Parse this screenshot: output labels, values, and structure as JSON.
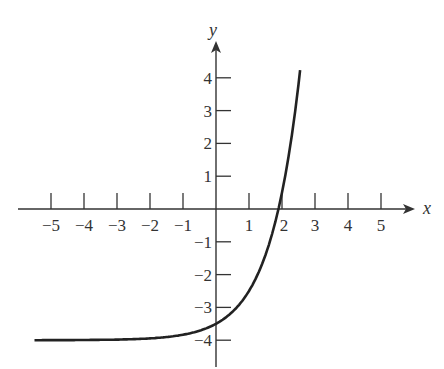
{
  "chart_data": {
    "type": "line",
    "title": "",
    "xlabel": "x",
    "ylabel": "y",
    "xlim": [
      -6,
      6
    ],
    "ylim": [
      -5,
      5
    ],
    "grid": false,
    "x_ticks": [
      -5,
      -4,
      -3,
      -2,
      -1,
      1,
      2,
      3,
      4,
      5
    ],
    "y_ticks": [
      -4,
      -3,
      -2,
      -1,
      1,
      2,
      3,
      4
    ],
    "x_tick_labels": [
      "−5",
      "−4",
      "−3",
      "−2",
      "−1",
      "1",
      "2",
      "3",
      "4",
      "5"
    ],
    "y_tick_labels": [
      "−4",
      "−3",
      "−2",
      "−1",
      "1",
      "2",
      "3",
      "4"
    ],
    "series": [
      {
        "name": "curve",
        "description": "exponential growth curve with horizontal asymptote y = -4",
        "x": [
          -5.5,
          -5,
          -4,
          -3,
          -2,
          -1,
          0,
          0.5,
          1,
          1.5,
          1.89,
          2,
          2.25,
          2.55
        ],
        "y": [
          -4.0,
          -4.0,
          -3.99,
          -3.98,
          -3.94,
          -3.83,
          -3.5,
          -3.13,
          -2.5,
          -1.4,
          0.0,
          0.5,
          1.9,
          4.3
        ]
      }
    ],
    "annotations": {
      "asymptote": -4,
      "y_intercept": -3.5,
      "x_intercept": 1.89
    }
  },
  "labels": {
    "x_axis": "x",
    "y_axis": "y"
  },
  "style": {
    "line_color": "#222222",
    "axis_color": "#333333"
  }
}
